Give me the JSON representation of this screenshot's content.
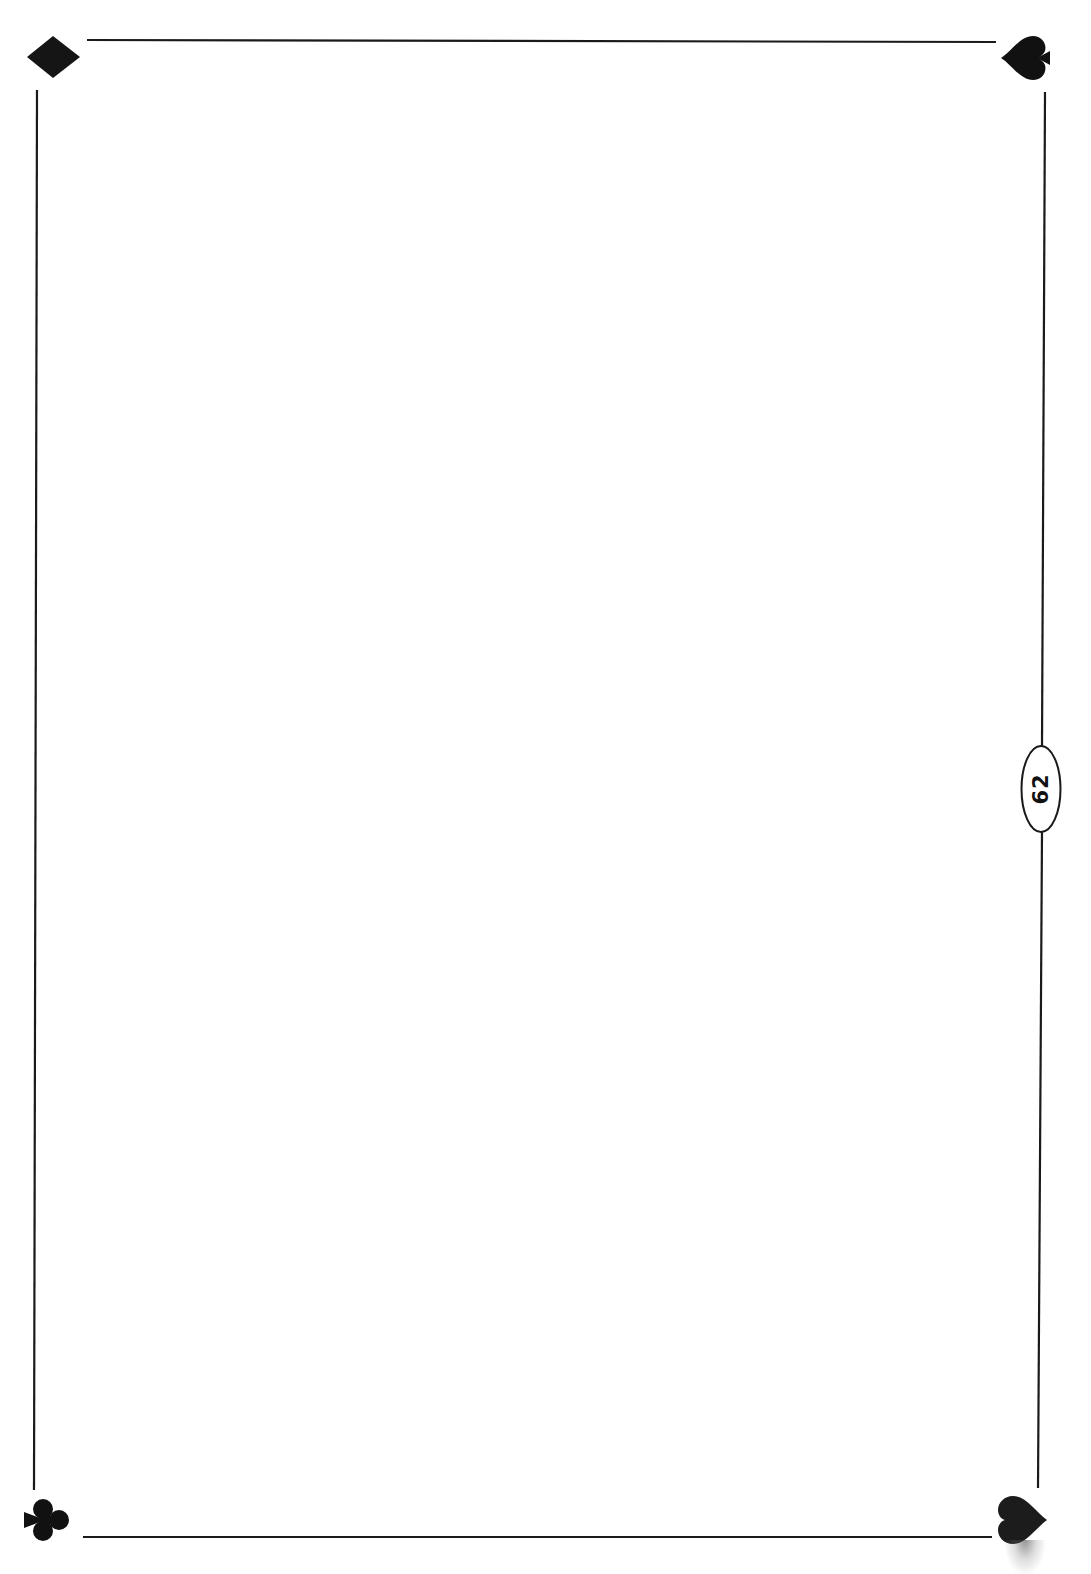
{
  "page": {
    "number": "62",
    "background": "#ffffff",
    "ink_color": "#1a1a1a"
  },
  "corners": {
    "top_left": {
      "suit": "diamond",
      "glyph": "♦"
    },
    "top_right": {
      "suit": "spade",
      "glyph": "♠"
    },
    "bottom_left": {
      "suit": "club",
      "glyph": "♣"
    },
    "bottom_right": {
      "suit": "heart",
      "glyph": "♥"
    }
  }
}
